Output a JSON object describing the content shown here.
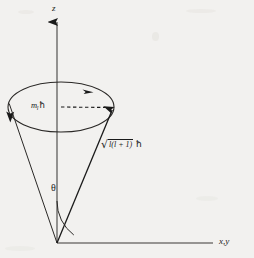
{
  "figure": {
    "background_color": "#f2f1ef",
    "ink_color": "#1a1a1a",
    "axes": {
      "z_label": "z",
      "xy_label": "x,y",
      "origin": {
        "x": 57,
        "y": 243
      },
      "z_axis": {
        "x1": 57,
        "y1": 243,
        "x2": 57,
        "y2": 18,
        "arrow": "up"
      },
      "xy_axis": {
        "x1": 57,
        "y1": 243,
        "x2": 213,
        "y2": 243,
        "arrow": "none"
      }
    },
    "cone": {
      "apex": {
        "x": 57,
        "y": 243
      },
      "base_ellipse": {
        "cx": 61,
        "cy": 107,
        "rx": 53,
        "ry": 25
      },
      "left_side": {
        "x1": 57,
        "y1": 243,
        "x2": 9,
        "y2": 104
      },
      "right_side": {
        "x1": 57,
        "y1": 243,
        "x2": 113,
        "y2": 108
      }
    },
    "precession_arrows": [
      {
        "name": "top-right-arrow",
        "direction": "right",
        "x": 89,
        "y": 93
      },
      {
        "name": "left-arrow",
        "direction": "down",
        "x": 10,
        "y": 117
      }
    ],
    "vector": {
      "name": "angular-momentum-vector",
      "from": {
        "x": 57,
        "y": 243
      },
      "to": {
        "x": 113,
        "y": 108
      },
      "label": {
        "radical": "√",
        "radicand": "l(l + 1)",
        "unit": "ħ",
        "full": "√(l(l+1)) ħ"
      }
    },
    "projection": {
      "name": "z-projection-dashed",
      "from": {
        "x": 61,
        "y": 107
      },
      "to": {
        "x": 113,
        "y": 107
      },
      "style": "dashed",
      "label": {
        "var": "m",
        "sub": "l",
        "unit": "ħ",
        "full": "mₗħ"
      }
    },
    "angle": {
      "name": "theta-angle",
      "symbol": "θ",
      "arc_radius": 40,
      "between": [
        "z_axis",
        "angular_momentum_vector"
      ]
    }
  }
}
